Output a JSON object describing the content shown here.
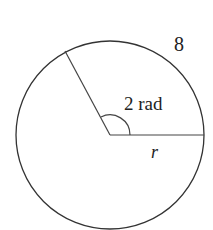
{
  "diagram": {
    "arc_length_label": "8",
    "angle_label": "2 rad",
    "radius_label": "r",
    "stroke_color": "#333333"
  }
}
